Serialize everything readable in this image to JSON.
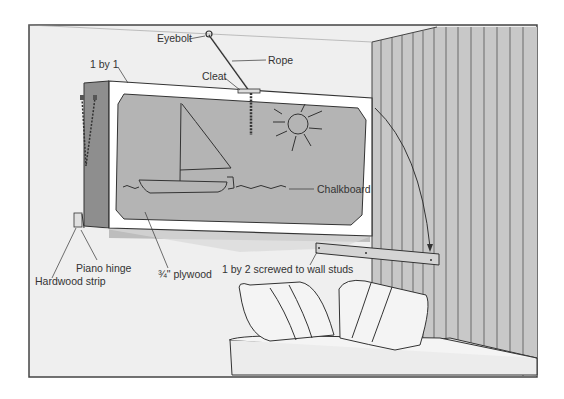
{
  "figure": {
    "colors": {
      "background": "#efefef",
      "frame_border": "#444444",
      "wall_panel": "#c8c8c8",
      "panel_lines": "#6a6a6a",
      "board_face": "#b4b4b4",
      "board_edge": "#ffffff",
      "board_side": "#8e8e8e",
      "line": "#333333"
    }
  },
  "labels": {
    "eyebolt": "Eyebolt",
    "rope": "Rope",
    "cleat": "Cleat",
    "one_by_one": "1 by 1",
    "chalkboard": "Chalkboard",
    "piano_hinge": "Piano hinge",
    "hardwood_strip": "Hardwood strip",
    "plywood": "¾\" plywood",
    "one_by_two": "1 by 2 screwed to wall studs"
  }
}
